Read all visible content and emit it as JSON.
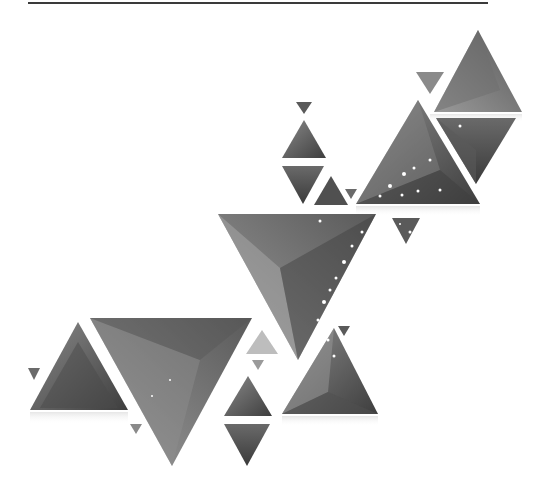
{
  "illustration": {
    "description": "Abstract grayscale geometric triangles with sparkle dots",
    "colors": {
      "background": "#ffffff",
      "rule": "#3a3a3a",
      "dark": "#4a4a4a",
      "mid": "#7a7a7a",
      "light": "#b5b5b5"
    },
    "triangle_count": 22
  }
}
